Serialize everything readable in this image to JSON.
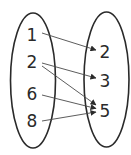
{
  "diagram": {
    "type": "mapping-diagram",
    "colors": {
      "stroke": "#2a2a2a",
      "arrow": "#4a4a4a",
      "background": "#ffffff"
    },
    "domain": {
      "items": [
        {
          "label": "1",
          "x": 32,
          "y": 41
        },
        {
          "label": "2",
          "x": 32,
          "y": 68
        },
        {
          "label": "6",
          "x": 32,
          "y": 100
        },
        {
          "label": "8",
          "x": 32,
          "y": 127
        }
      ]
    },
    "range": {
      "items": [
        {
          "label": "2",
          "x": 105,
          "y": 58
        },
        {
          "label": "3",
          "x": 105,
          "y": 87
        },
        {
          "label": "5",
          "x": 105,
          "y": 117
        }
      ]
    },
    "mappings": [
      {
        "from": "1",
        "to": "2"
      },
      {
        "from": "2",
        "to": "3"
      },
      {
        "from": "2",
        "to": "5"
      },
      {
        "from": "6",
        "to": "5"
      },
      {
        "from": "8",
        "to": "5"
      }
    ]
  }
}
